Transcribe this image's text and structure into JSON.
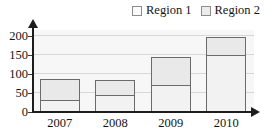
{
  "chart_data": {
    "type": "bar",
    "subtype": "stacked-bar",
    "title": "",
    "subtitle": "",
    "xlabel": "",
    "ylabel": "",
    "categories": [
      "2007",
      "2008",
      "2009",
      "2010"
    ],
    "series": [
      {
        "name": "Region 1",
        "values": [
          30,
          41,
          68,
          148
        ],
        "color": "#f2f2f2"
      },
      {
        "name": "Region 2",
        "values": [
          57,
          42,
          77,
          48
        ],
        "color": "#e9e9e9"
      }
    ],
    "totals": [
      87,
      83,
      145,
      196
    ],
    "ylim": [
      0,
      215
    ],
    "yticks": [
      0,
      50,
      100,
      150,
      200
    ],
    "ytick_labels": [
      "0",
      "50",
      "100",
      "150",
      "200"
    ],
    "grid": true,
    "grid_axis": "y",
    "legend_position": "top-right",
    "axis_arrows": true
  },
  "legend": {
    "entries": [
      {
        "label": "Region 1",
        "swatch": "legend-swatch-region-1"
      },
      {
        "label": "Region 2",
        "swatch": "legend-swatch-region-2"
      }
    ]
  },
  "axes": {
    "y": {
      "ticks": [
        "200",
        "150",
        "100",
        "50",
        "0"
      ]
    },
    "x": {
      "ticks": [
        "2007",
        "2008",
        "2009",
        "2010"
      ]
    }
  },
  "colors": {
    "plot_background": "#f7f7f7",
    "gridline": "#d7d7d7",
    "axis": "#1d1d1d",
    "bar_border": "#6b6b6b",
    "region1_fill": "#f2f2f2",
    "region2_fill": "#e9e9e9",
    "text": "#141414"
  }
}
